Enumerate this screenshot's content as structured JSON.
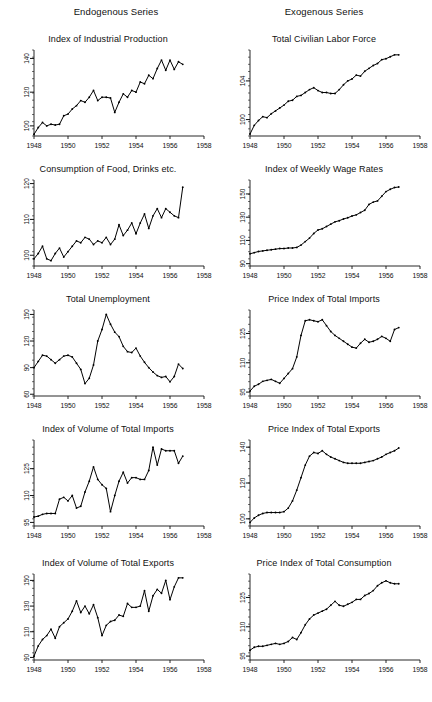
{
  "figure": {
    "headers": {
      "left": "Endogenous Series",
      "right": "Exogenous Series"
    }
  },
  "chart_data": [
    {
      "type": "line",
      "title": "Index of Industrial Production",
      "column": "Endogenous Series",
      "xlabel": "",
      "ylabel": "",
      "xlim": [
        1948,
        1958
      ],
      "ylim": [
        94,
        145
      ],
      "xticks": [
        1948,
        1950,
        1952,
        1954,
        1956,
        1958
      ],
      "yticks": [
        100,
        120,
        140
      ],
      "grid": false,
      "legend": "none",
      "x": [
        1948.0,
        1948.25,
        1948.5,
        1948.75,
        1949.0,
        1949.25,
        1949.5,
        1949.75,
        1950.0,
        1950.25,
        1950.5,
        1950.75,
        1951.0,
        1951.25,
        1951.5,
        1951.75,
        1952.0,
        1952.25,
        1952.5,
        1952.75,
        1953.0,
        1953.25,
        1953.5,
        1953.75,
        1954.0,
        1954.25,
        1954.5,
        1954.75,
        1955.0,
        1955.25,
        1955.5,
        1955.75,
        1956.0,
        1956.25,
        1956.5,
        1956.75
      ],
      "values": [
        95.0,
        99.0,
        102.0,
        100.0,
        101.0,
        100.5,
        101.0,
        106.0,
        107.0,
        110.0,
        112.0,
        115.0,
        114.0,
        117.0,
        121.0,
        115.0,
        117.0,
        117.0,
        116.5,
        108.0,
        114.0,
        119.0,
        117.0,
        121.0,
        120.0,
        126.0,
        125.0,
        130.0,
        128.0,
        134.0,
        139.0,
        133.0,
        139.0,
        133.5,
        138.0,
        136.5
      ]
    },
    {
      "type": "line",
      "title": "Total Civilian Labor Force",
      "column": "Exogenous Series",
      "xlabel": "",
      "ylabel": "",
      "xlim": [
        1948,
        1958
      ],
      "ylim": [
        98.3,
        107.2
      ],
      "xticks": [
        1948,
        1950,
        1952,
        1954,
        1956,
        1958
      ],
      "yticks": [
        100,
        104
      ],
      "grid": false,
      "legend": "none",
      "x": [
        1948.0,
        1948.25,
        1948.5,
        1948.75,
        1949.0,
        1949.25,
        1949.5,
        1949.75,
        1950.0,
        1950.25,
        1950.5,
        1950.75,
        1951.0,
        1951.25,
        1951.5,
        1951.75,
        1952.0,
        1952.25,
        1952.5,
        1952.75,
        1953.0,
        1953.25,
        1953.5,
        1953.75,
        1954.0,
        1954.25,
        1954.5,
        1954.75,
        1955.0,
        1955.25,
        1955.5,
        1955.75,
        1956.0,
        1956.25,
        1956.5,
        1956.75
      ],
      "values": [
        98.5,
        99.4,
        99.9,
        100.3,
        100.2,
        100.6,
        100.9,
        101.2,
        101.5,
        101.9,
        102.0,
        102.4,
        102.5,
        102.8,
        103.1,
        103.3,
        103.0,
        102.8,
        102.8,
        102.7,
        102.7,
        103.1,
        103.6,
        104.0,
        104.2,
        104.6,
        104.5,
        105.0,
        105.3,
        105.6,
        105.8,
        106.2,
        106.3,
        106.5,
        106.7,
        106.7
      ]
    },
    {
      "type": "line",
      "title": "Consumption of Food, Drinks etc.",
      "column": "Endogenous Series",
      "xlabel": "",
      "ylabel": "",
      "xlim": [
        1948,
        1958
      ],
      "ylim": [
        97,
        121
      ],
      "xticks": [
        1948,
        1950,
        1952,
        1954,
        1956,
        1958
      ],
      "yticks": [
        100,
        110,
        120
      ],
      "grid": false,
      "legend": "none",
      "x": [
        1948.0,
        1948.25,
        1948.5,
        1948.75,
        1949.0,
        1949.25,
        1949.5,
        1949.75,
        1950.0,
        1950.25,
        1950.5,
        1950.75,
        1951.0,
        1951.25,
        1951.5,
        1951.75,
        1952.0,
        1952.25,
        1952.5,
        1952.75,
        1953.0,
        1953.25,
        1953.5,
        1953.75,
        1954.0,
        1954.25,
        1954.5,
        1954.75,
        1955.0,
        1955.25,
        1955.5,
        1955.75,
        1956.0,
        1956.25,
        1956.5,
        1956.75
      ],
      "values": [
        99.0,
        100.5,
        102.5,
        99.0,
        98.5,
        100.5,
        102.0,
        99.5,
        101.0,
        102.5,
        104.0,
        103.5,
        105.0,
        104.5,
        103.0,
        104.0,
        103.5,
        105.0,
        103.0,
        104.5,
        108.5,
        105.5,
        107.0,
        109.0,
        106.0,
        109.0,
        111.5,
        107.5,
        111.0,
        113.0,
        110.5,
        113.0,
        112.0,
        111.0,
        110.5,
        119.0
      ]
    },
    {
      "type": "line",
      "title": "Index of Weekly Wage Rates",
      "column": "Exogenous Series",
      "xlabel": "",
      "ylabel": "",
      "xlim": [
        1948,
        1958
      ],
      "ylim": [
        88,
        162
      ],
      "xticks": [
        1948,
        1950,
        1952,
        1954,
        1956,
        1958
      ],
      "yticks": [
        90,
        110,
        130,
        150
      ],
      "grid": false,
      "legend": "none",
      "x": [
        1948.0,
        1948.25,
        1948.5,
        1948.75,
        1949.0,
        1949.25,
        1949.5,
        1949.75,
        1950.0,
        1950.25,
        1950.5,
        1950.75,
        1951.0,
        1951.25,
        1951.5,
        1951.75,
        1952.0,
        1952.25,
        1952.5,
        1952.75,
        1953.0,
        1953.25,
        1953.5,
        1953.75,
        1954.0,
        1954.25,
        1954.5,
        1954.75,
        1955.0,
        1955.25,
        1955.5,
        1955.75,
        1956.0,
        1956.25,
        1956.5,
        1956.75
      ],
      "values": [
        98.5,
        99.5,
        100.5,
        101.0,
        101.5,
        102.0,
        102.5,
        103.0,
        103.0,
        103.5,
        103.5,
        104.0,
        106.0,
        109.0,
        112.0,
        116.0,
        119.0,
        120.0,
        122.0,
        124.0,
        126.0,
        127.0,
        128.5,
        129.5,
        131.0,
        132.0,
        134.0,
        136.0,
        141.0,
        143.0,
        144.0,
        148.0,
        152.0,
        154.0,
        155.5,
        156.0
      ]
    },
    {
      "type": "line",
      "title": "Total Unemployment",
      "column": "Endogenous Series",
      "xlabel": "",
      "ylabel": "",
      "xlim": [
        1948,
        1958
      ],
      "ylim": [
        58,
        155
      ],
      "xticks": [
        1948,
        1950,
        1952,
        1954,
        1956,
        1958
      ],
      "yticks": [
        60,
        90,
        120,
        150
      ],
      "grid": false,
      "legend": "none",
      "x": [
        1948.0,
        1948.25,
        1948.5,
        1948.75,
        1949.0,
        1949.25,
        1949.5,
        1949.75,
        1950.0,
        1950.25,
        1950.5,
        1950.75,
        1951.0,
        1951.25,
        1951.5,
        1951.75,
        1952.0,
        1952.25,
        1952.5,
        1952.75,
        1953.0,
        1953.25,
        1953.5,
        1953.75,
        1954.0,
        1954.25,
        1954.5,
        1954.75,
        1955.0,
        1955.25,
        1955.5,
        1955.75,
        1956.0,
        1956.25,
        1956.5,
        1956.75
      ],
      "values": [
        90.0,
        97.0,
        104.0,
        103.0,
        99.0,
        95.0,
        99.0,
        103.0,
        104.0,
        102.0,
        95.0,
        88.0,
        72.0,
        78.0,
        93.0,
        120.0,
        133.0,
        150.0,
        139.0,
        130.0,
        125.0,
        114.0,
        108.0,
        107.0,
        112.0,
        103.0,
        96.0,
        90.0,
        85.0,
        81.0,
        79.0,
        80.0,
        74.0,
        80.0,
        94.0,
        89.0
      ]
    },
    {
      "type": "line",
      "title": "Price Index of Total Imports",
      "column": "Exogenous Series",
      "xlabel": "",
      "ylabel": "",
      "xlim": [
        1948,
        1958
      ],
      "ylim": [
        93,
        137
      ],
      "xticks": [
        1948,
        1950,
        1952,
        1954,
        1956,
        1958
      ],
      "yticks": [
        95,
        110,
        125
      ],
      "grid": false,
      "legend": "none",
      "x": [
        1948.0,
        1948.25,
        1948.5,
        1948.75,
        1949.0,
        1949.25,
        1949.5,
        1949.75,
        1950.0,
        1950.25,
        1950.5,
        1950.75,
        1951.0,
        1951.25,
        1951.5,
        1951.75,
        1952.0,
        1952.25,
        1952.5,
        1952.75,
        1953.0,
        1953.25,
        1953.5,
        1953.75,
        1954.0,
        1954.25,
        1954.5,
        1954.75,
        1955.0,
        1955.25,
        1955.5,
        1955.75,
        1956.0,
        1956.25,
        1956.5,
        1956.75
      ],
      "values": [
        95.5,
        98.0,
        99.0,
        100.5,
        101.0,
        101.5,
        100.5,
        99.5,
        102.0,
        104.5,
        107.0,
        113.0,
        124.0,
        131.5,
        132.0,
        131.5,
        131.0,
        132.0,
        129.0,
        126.0,
        124.0,
        122.5,
        121.0,
        119.5,
        118.0,
        117.5,
        120.0,
        122.0,
        120.5,
        121.0,
        122.0,
        123.5,
        122.5,
        121.0,
        127.0,
        128.0
      ]
    },
    {
      "type": "line",
      "title": "Index of Volume of Total Imports",
      "column": "Endogenous Series",
      "xlabel": "",
      "ylabel": "",
      "xlim": [
        1948,
        1958
      ],
      "ylim": [
        93,
        141
      ],
      "xticks": [
        1948,
        1950,
        1952,
        1954,
        1956,
        1958
      ],
      "yticks": [
        95,
        110,
        125
      ],
      "grid": false,
      "legend": "none",
      "x": [
        1948.0,
        1948.25,
        1948.5,
        1948.75,
        1949.0,
        1949.25,
        1949.5,
        1949.75,
        1950.0,
        1950.25,
        1950.5,
        1950.75,
        1951.0,
        1951.25,
        1951.5,
        1951.75,
        1952.0,
        1952.25,
        1952.5,
        1952.75,
        1953.0,
        1953.25,
        1953.5,
        1953.75,
        1954.0,
        1954.25,
        1954.5,
        1954.75,
        1955.0,
        1955.25,
        1955.5,
        1955.75,
        1956.0,
        1956.25,
        1956.5,
        1956.75
      ],
      "values": [
        98.0,
        98.5,
        99.5,
        100.0,
        100.0,
        100.0,
        108.0,
        109.0,
        107.0,
        110.0,
        103.0,
        104.0,
        112.0,
        118.0,
        126.0,
        119.0,
        116.0,
        114.0,
        101.0,
        110.0,
        118.0,
        123.0,
        117.0,
        120.0,
        120.0,
        119.0,
        119.0,
        124.0,
        137.0,
        127.0,
        136.0,
        135.0,
        135.0,
        135.0,
        128.0,
        132.0
      ]
    },
    {
      "type": "line",
      "title": "Price Index of Total Exports",
      "column": "Exogenous Series",
      "xlabel": "",
      "ylabel": "",
      "xlim": [
        1948,
        1958
      ],
      "ylim": [
        96,
        144
      ],
      "xticks": [
        1948,
        1950,
        1952,
        1954,
        1956,
        1958
      ],
      "yticks": [
        100,
        120,
        140
      ],
      "grid": false,
      "legend": "none",
      "x": [
        1948.0,
        1948.25,
        1948.5,
        1948.75,
        1949.0,
        1949.25,
        1949.5,
        1949.75,
        1950.0,
        1950.25,
        1950.5,
        1950.75,
        1951.0,
        1951.25,
        1951.5,
        1951.75,
        1952.0,
        1952.25,
        1952.5,
        1952.75,
        1953.0,
        1953.25,
        1953.5,
        1953.75,
        1954.0,
        1954.25,
        1954.5,
        1954.75,
        1955.0,
        1955.25,
        1955.5,
        1955.75,
        1956.0,
        1956.25,
        1956.5,
        1956.75
      ],
      "values": [
        98.0,
        100.5,
        102.0,
        103.0,
        103.5,
        103.5,
        103.5,
        103.5,
        104.0,
        106.0,
        110.0,
        116.0,
        123.0,
        130.0,
        135.0,
        137.0,
        136.5,
        138.0,
        136.0,
        134.5,
        133.5,
        132.5,
        131.5,
        131.0,
        131.0,
        131.0,
        131.0,
        131.5,
        132.0,
        132.5,
        133.5,
        134.5,
        136.0,
        137.0,
        138.0,
        139.5
      ]
    },
    {
      "type": "line",
      "title": "Index of Volume of Total Exports",
      "column": "Endogenous Series",
      "xlabel": "",
      "ylabel": "",
      "xlim": [
        1948,
        1958
      ],
      "ylim": [
        88,
        155
      ],
      "xticks": [
        1948,
        1950,
        1952,
        1954,
        1956,
        1958
      ],
      "yticks": [
        90,
        110,
        130,
        150
      ],
      "grid": false,
      "legend": "none",
      "x": [
        1948.0,
        1948.25,
        1948.5,
        1948.75,
        1949.0,
        1949.25,
        1949.5,
        1949.75,
        1950.0,
        1950.25,
        1950.5,
        1950.75,
        1951.0,
        1951.25,
        1951.5,
        1951.75,
        1952.0,
        1952.25,
        1952.5,
        1952.75,
        1953.0,
        1953.25,
        1953.5,
        1953.75,
        1954.0,
        1954.25,
        1954.5,
        1954.75,
        1955.0,
        1955.25,
        1955.5,
        1955.75,
        1956.0,
        1956.25,
        1956.5,
        1956.75
      ],
      "values": [
        91.0,
        99.0,
        104.0,
        107.0,
        112.0,
        105.0,
        114.0,
        117.0,
        120.0,
        126.0,
        134.0,
        125.0,
        130.0,
        124.0,
        131.0,
        121.0,
        107.0,
        115.0,
        118.0,
        119.0,
        123.0,
        122.0,
        132.0,
        129.0,
        129.0,
        130.0,
        142.0,
        126.0,
        138.0,
        143.0,
        140.0,
        150.0,
        135.0,
        145.0,
        152.0,
        152.0
      ]
    },
    {
      "type": "line",
      "title": "Price Index of Total Consumption",
      "column": "Exogenous Series",
      "xlabel": "",
      "ylabel": "",
      "xlim": [
        1948,
        1958
      ],
      "ylim": [
        93,
        137
      ],
      "xticks": [
        1948,
        1950,
        1952,
        1954,
        1956,
        1958
      ],
      "yticks": [
        95,
        110,
        125
      ],
      "grid": false,
      "legend": "none",
      "x": [
        1948.0,
        1948.25,
        1948.5,
        1948.75,
        1949.0,
        1949.25,
        1949.5,
        1949.75,
        1950.0,
        1950.25,
        1950.5,
        1950.75,
        1951.0,
        1951.25,
        1951.5,
        1951.75,
        1952.0,
        1952.25,
        1952.5,
        1952.75,
        1953.0,
        1953.25,
        1953.5,
        1953.75,
        1954.0,
        1954.25,
        1954.5,
        1954.75,
        1955.0,
        1955.25,
        1955.5,
        1955.75,
        1956.0,
        1956.25,
        1956.5,
        1956.75
      ],
      "values": [
        98.0,
        99.5,
        100.0,
        100.0,
        100.5,
        101.0,
        101.5,
        101.0,
        101.5,
        102.5,
        104.5,
        103.5,
        107.0,
        111.0,
        114.0,
        116.0,
        117.0,
        118.0,
        119.0,
        121.0,
        123.0,
        121.0,
        120.5,
        121.5,
        122.5,
        124.0,
        124.0,
        126.0,
        127.0,
        128.5,
        131.0,
        132.5,
        133.5,
        132.5,
        132.0,
        132.0
      ]
    }
  ]
}
